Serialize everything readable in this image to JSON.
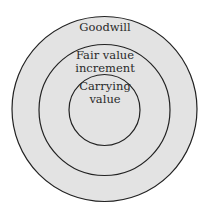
{
  "diagram": {
    "type": "concentric-circles",
    "fill_color": "#e3e3e3",
    "stroke_color": "#222222",
    "rings": [
      {
        "id": "outer",
        "label": "Goodwill"
      },
      {
        "id": "middle",
        "label_line1": "Fair value",
        "label_line2": "increment"
      },
      {
        "id": "inner",
        "label_line1": "Carrying",
        "label_line2": "value"
      }
    ]
  }
}
